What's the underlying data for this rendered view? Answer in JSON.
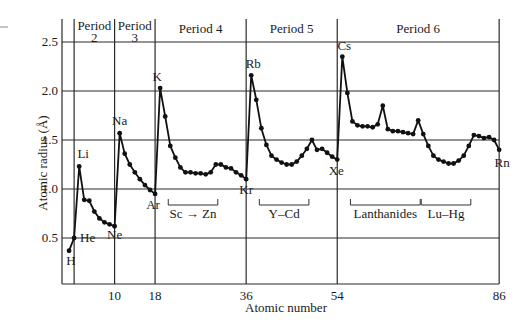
{
  "chart_data": {
    "type": "line",
    "title": "",
    "xlabel": "Atomic number",
    "ylabel": "Atomic radius (Å)",
    "xlim": [
      0,
      86
    ],
    "ylim": [
      0,
      2.6
    ],
    "yticks": [
      0.5,
      1.0,
      1.5,
      2.0,
      2.5
    ],
    "ytick_labels": [
      "0.5",
      "1.0",
      "1.5",
      "2.0",
      "2.5"
    ],
    "xticks": [
      10,
      18,
      36,
      54,
      86
    ],
    "xtick_labels": [
      "10",
      "18",
      "36",
      "54",
      "86"
    ],
    "grid": "horizontal",
    "legend": null,
    "period_boundaries": [
      2,
      10,
      18,
      36,
      54,
      86
    ],
    "periods": [
      {
        "label_line1": "Period",
        "label_line2": "2",
        "from": 2,
        "to": 10
      },
      {
        "label_line1": "Period",
        "label_line2": "3",
        "from": 10,
        "to": 18
      },
      {
        "label_line1": "Period 4",
        "label_line2": "",
        "from": 18,
        "to": 36
      },
      {
        "label_line1": "Period 5",
        "label_line2": "",
        "from": 36,
        "to": 54
      },
      {
        "label_line1": "Period 6",
        "label_line2": "",
        "from": 54,
        "to": 86
      }
    ],
    "series": [
      {
        "name": "Atomic radius",
        "x": [
          1,
          2,
          3,
          4,
          5,
          6,
          7,
          8,
          9,
          10,
          11,
          12,
          13,
          14,
          15,
          16,
          17,
          18,
          19,
          20,
          21,
          22,
          23,
          24,
          25,
          26,
          27,
          28,
          29,
          30,
          31,
          32,
          33,
          34,
          35,
          36,
          37,
          38,
          39,
          40,
          41,
          42,
          43,
          44,
          45,
          46,
          47,
          48,
          49,
          50,
          51,
          52,
          53,
          54,
          55,
          56,
          57,
          58,
          59,
          60,
          61,
          62,
          63,
          64,
          65,
          66,
          67,
          68,
          69,
          70,
          71,
          72,
          73,
          74,
          75,
          76,
          77,
          78,
          79,
          80,
          81,
          82,
          83,
          84,
          85,
          86
        ],
        "values": [
          0.37,
          0.5,
          1.23,
          0.89,
          0.88,
          0.77,
          0.7,
          0.66,
          0.64,
          0.62,
          1.57,
          1.36,
          1.25,
          1.17,
          1.1,
          1.04,
          0.99,
          0.95,
          2.03,
          1.74,
          1.44,
          1.32,
          1.22,
          1.17,
          1.17,
          1.16,
          1.16,
          1.15,
          1.17,
          1.25,
          1.25,
          1.22,
          1.21,
          1.17,
          1.14,
          1.1,
          2.16,
          1.91,
          1.62,
          1.45,
          1.34,
          1.3,
          1.27,
          1.25,
          1.25,
          1.28,
          1.34,
          1.41,
          1.5,
          1.4,
          1.41,
          1.37,
          1.33,
          1.3,
          2.35,
          1.98,
          1.69,
          1.65,
          1.64,
          1.64,
          1.63,
          1.66,
          1.85,
          1.61,
          1.59,
          1.59,
          1.58,
          1.57,
          1.56,
          1.7,
          1.56,
          1.44,
          1.34,
          1.3,
          1.28,
          1.26,
          1.26,
          1.29,
          1.34,
          1.44,
          1.55,
          1.54,
          1.52,
          1.53,
          1.5,
          1.4
        ]
      }
    ],
    "annotations": [
      {
        "text": "H",
        "z": 1
      },
      {
        "text": "He",
        "z": 2
      },
      {
        "text": "Li",
        "z": 3
      },
      {
        "text": "Ne",
        "z": 10
      },
      {
        "text": "Na",
        "z": 11
      },
      {
        "text": "Ar",
        "z": 18
      },
      {
        "text": "K",
        "z": 19
      },
      {
        "text": "Kr",
        "z": 36
      },
      {
        "text": "Rb",
        "z": 37
      },
      {
        "text": "Xe",
        "z": 54
      },
      {
        "text": "Cs",
        "z": 55
      },
      {
        "text": "Rn",
        "z": 86
      }
    ],
    "brackets": [
      {
        "text": "Sc → Zn",
        "from": 21,
        "to": 30
      },
      {
        "text": "Y–Cd",
        "from": 39,
        "to": 48
      },
      {
        "text": "Lanthanides",
        "from": 57,
        "to": 70
      },
      {
        "text": "Lu–Hg",
        "from": 71,
        "to": 80
      }
    ]
  },
  "labels": {
    "xlabel": "Atomic number",
    "ylabel": "Atomic radius (Å)"
  }
}
